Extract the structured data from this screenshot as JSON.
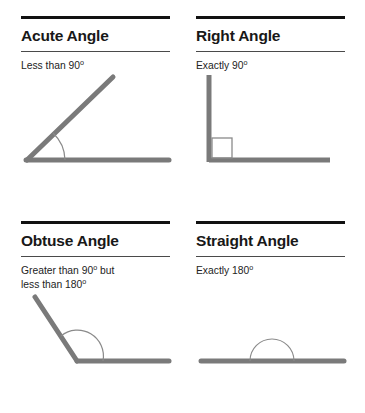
{
  "page": {
    "background_color": "#ffffff",
    "rule_color": "#111111",
    "sub_rule_color": "#4a4a4a",
    "ray_color": "#7a7a7a",
    "arc_color": "#888888",
    "text_color": "#181818"
  },
  "cards": [
    {
      "id": "acute",
      "heading": "Acute Angle",
      "description_lines": [
        "Less than 90"
      ],
      "degree_symbol": "o",
      "description_plain": "Less than 90o",
      "figure": {
        "type": "acute-angle",
        "marker": "arc",
        "angle_degrees": 45,
        "vertex": "bottom-left"
      }
    },
    {
      "id": "right",
      "heading": "Right Angle",
      "description_lines": [
        "Exactly 90"
      ],
      "degree_symbol": "o",
      "description_plain": "Exactly 90o",
      "figure": {
        "type": "right-angle",
        "marker": "square",
        "angle_degrees": 90,
        "vertex": "bottom-left"
      }
    },
    {
      "id": "obtuse",
      "heading": "Obtuse Angle",
      "description_lines": [
        "Greater than 90",
        " but",
        "less than 180"
      ],
      "degree_symbol": "o",
      "description_plain": "Greater than 90o but less than 180o",
      "figure": {
        "type": "obtuse-angle",
        "marker": "arc",
        "angle_degrees": 125,
        "vertex": "bottom-left"
      }
    },
    {
      "id": "straight",
      "heading": "Straight Angle",
      "description_lines": [
        "Exactly 180"
      ],
      "degree_symbol": "o",
      "description_plain": "Exactly 180o",
      "figure": {
        "type": "straight-angle",
        "marker": "semicircle-arc",
        "angle_degrees": 180,
        "vertex": "center"
      }
    }
  ]
}
